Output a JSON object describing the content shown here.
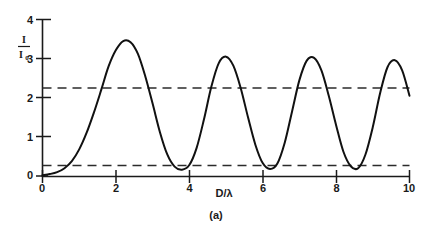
{
  "figure": {
    "caption": "(a)",
    "background_color": "#ffffff",
    "curve_color": "#111111",
    "axis_color": "#1a1a1a",
    "dashed_line_color": "#2b2b2b"
  },
  "chart_data": {
    "type": "line",
    "title": "",
    "subtitle": "",
    "xlabel": "D/λ",
    "ylabel": "I/I₀",
    "ylabel_numerator": "I",
    "ylabel_denominator": "I",
    "ylabel_denominator_subscript": "0",
    "xlim": [
      0,
      10
    ],
    "ylim": [
      0,
      4
    ],
    "xticks": [
      0,
      2,
      4,
      6,
      8,
      10
    ],
    "xtick_labels": [
      "0",
      "2",
      "4",
      "6",
      "8",
      "10"
    ],
    "yticks": [
      0,
      1,
      2,
      3,
      4
    ],
    "ytick_labels": [
      "0",
      "1",
      "2",
      "3",
      "4"
    ],
    "grid": false,
    "legend": null,
    "legend_position": "none",
    "series": [
      {
        "name": "intensity-ratio",
        "style": "solid",
        "x": [
          0.0,
          0.2,
          0.4,
          0.6,
          0.8,
          1.0,
          1.2,
          1.4,
          1.6,
          1.8,
          2.0,
          2.2,
          2.4,
          2.6,
          2.8,
          3.0,
          3.2,
          3.4,
          3.6,
          3.8,
          4.0,
          4.2,
          4.4,
          4.6,
          4.8,
          5.0,
          5.2,
          5.4,
          5.6,
          5.8,
          6.0,
          6.2,
          6.4,
          6.6,
          6.8,
          7.0,
          7.2,
          7.4,
          7.6,
          7.8,
          8.0,
          8.2,
          8.4,
          8.6,
          8.8,
          9.0,
          9.2,
          9.4,
          9.6,
          9.8,
          10.0
        ],
        "y": [
          0.02,
          0.05,
          0.1,
          0.2,
          0.38,
          0.68,
          1.1,
          1.62,
          2.2,
          2.8,
          3.22,
          3.45,
          3.42,
          3.12,
          2.55,
          1.85,
          1.12,
          0.55,
          0.24,
          0.16,
          0.28,
          0.72,
          1.45,
          2.28,
          2.88,
          3.05,
          2.82,
          2.25,
          1.5,
          0.8,
          0.33,
          0.18,
          0.32,
          0.85,
          1.65,
          2.45,
          2.95,
          3.02,
          2.7,
          2.05,
          1.3,
          0.62,
          0.25,
          0.2,
          0.55,
          1.25,
          2.12,
          2.78,
          2.96,
          2.7,
          2.05
        ]
      },
      {
        "name": "upper-reference-line",
        "style": "dashed",
        "constant_y": 2.25,
        "x_range": [
          0,
          10
        ]
      },
      {
        "name": "lower-reference-line",
        "style": "dashed",
        "constant_y": 0.27,
        "x_range": [
          0,
          10
        ]
      }
    ],
    "annotations": [
      {
        "text": "(a)",
        "role": "figure-caption"
      }
    ]
  }
}
